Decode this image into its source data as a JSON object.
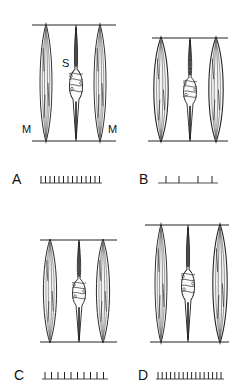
{
  "figure": {
    "panels": [
      {
        "id": "A",
        "label": "A",
        "spike_count": 14,
        "fiber_labels": {
          "spindle": "S",
          "muscle_left": "M",
          "muscle_right": "M"
        }
      },
      {
        "id": "B",
        "label": "B",
        "spike_count": 4
      },
      {
        "id": "C",
        "label": "C",
        "spike_count": 10
      },
      {
        "id": "D",
        "label": "D",
        "spike_count": 16
      }
    ]
  }
}
